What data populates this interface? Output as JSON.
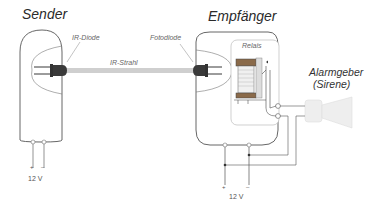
{
  "diagram": {
    "sender": {
      "title": "Sender",
      "component_label": "IR-Diode",
      "polarity_plus": "+",
      "polarity_minus": "–",
      "voltage": "12 V"
    },
    "beam": {
      "label": "IR-Strahl"
    },
    "receiver": {
      "title": "Empfänger",
      "component_label": "Fotodiode",
      "relay_label": "Relais",
      "polarity_plus": "+",
      "polarity_minus": "–",
      "voltage": "12 V"
    },
    "alarm": {
      "line1": "Alarmgeber",
      "line2": "(Sirene)"
    },
    "colors": {
      "outline": "#555555",
      "beam": "#c8c8c8",
      "diode": "#3a3a3a",
      "relay_box": "#bbbbbb",
      "siren_fill": "#eeeeee"
    }
  }
}
